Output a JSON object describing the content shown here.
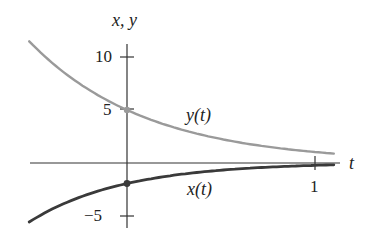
{
  "chart_data": {
    "type": "line",
    "title": "",
    "xlabel": "t",
    "ylabel": "x, y",
    "x_ticks": [
      {
        "value": 1,
        "label": "1"
      }
    ],
    "y_ticks": [
      {
        "value": 10,
        "label": "10"
      },
      {
        "value": 5,
        "label": "5"
      },
      {
        "value": -5,
        "label": "−5"
      }
    ],
    "xlim": [
      -0.52,
      1.1
    ],
    "ylim": [
      -6,
      12
    ],
    "grid": false,
    "legend": "inline labels",
    "series": [
      {
        "name": "y(t)",
        "color": "#9a9a9a",
        "x": [
          -0.52,
          -0.25,
          0,
          0.25,
          0.5,
          0.75,
          1.0,
          1.1
        ],
        "values": [
          11.5,
          7.5,
          5.0,
          3.35,
          2.25,
          1.5,
          1.0,
          0.85
        ],
        "initial_point": {
          "t": 0,
          "value": 5
        }
      },
      {
        "name": "x(t)",
        "color": "#3a3a3a",
        "x": [
          -0.52,
          -0.25,
          0,
          0.25,
          0.5,
          0.75,
          1.0,
          1.1
        ],
        "values": [
          -5.65,
          -3.3,
          -2.0,
          -1.2,
          -0.75,
          -0.45,
          -0.27,
          -0.22
        ],
        "initial_point": {
          "t": 0,
          "value": -2
        }
      }
    ],
    "annotations": [
      {
        "text": "y(t)",
        "near_series": "y(t)"
      },
      {
        "text": "x(t)",
        "near_series": "x(t)"
      }
    ]
  },
  "labels": {
    "axis_y": "x, y",
    "axis_x": "t",
    "tick_10": "10",
    "tick_5": "5",
    "tick_m5": "−5",
    "tick_t1": "1",
    "series_y": "y(t)",
    "series_x": "x(t)"
  }
}
